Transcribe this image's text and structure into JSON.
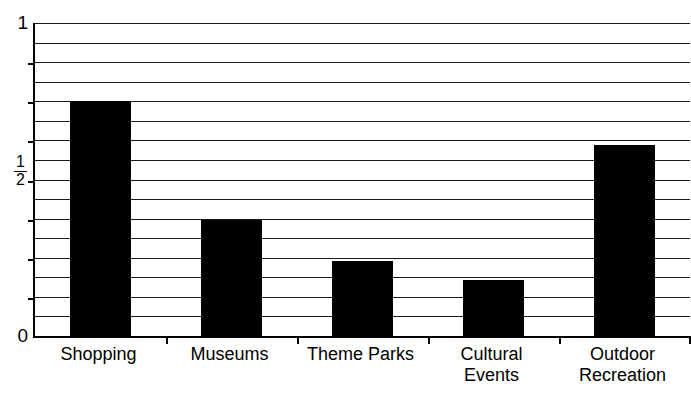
{
  "chart_data": {
    "type": "bar",
    "title": "",
    "subtitle": "",
    "xlabel": "",
    "ylabel": "",
    "categories": [
      "Shopping",
      "Museums",
      "Theme Parks",
      "Cultural\nEvents",
      "Outdoor\nRecreation"
    ],
    "values": [
      0.75,
      0.37,
      0.24,
      0.18,
      0.61
    ],
    "ylim": [
      0,
      1
    ],
    "ytick_labels": [
      "1",
      "1/2",
      "0"
    ],
    "ytick_values": [
      1,
      0.5,
      0
    ],
    "grid": true,
    "gridline_count": 16,
    "legend": "none",
    "bar_color": "#000000",
    "background_color": "#ffffff",
    "axis_color": "#000000"
  },
  "axis": {
    "y_top_label": "1",
    "y_mid_numerator": "1",
    "y_mid_denominator": "2",
    "y_bottom_label": "0"
  },
  "bars": [
    {
      "name": "shopping",
      "label": "Shopping",
      "value": 0.75
    },
    {
      "name": "museums",
      "label": "Museums",
      "value": 0.37
    },
    {
      "name": "theme-parks",
      "label": "Theme Parks",
      "value": 0.24
    },
    {
      "name": "cultural-events",
      "label": "Cultural\nEvents",
      "value": 0.18
    },
    {
      "name": "outdoor-recreation",
      "label": "Outdoor\nRecreation",
      "value": 0.61
    }
  ]
}
